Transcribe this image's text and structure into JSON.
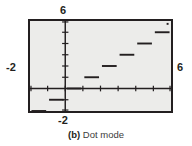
{
  "figure": {
    "caption_letter": "(b)",
    "caption_text": "Dot mode",
    "screen_background": "#ececea",
    "ink_color": "#231f20"
  },
  "axis_labels": {
    "top": "6",
    "left": "-2",
    "right": "6",
    "bottom": "-2"
  },
  "chart_data": {
    "type": "line",
    "title": "Dot mode",
    "xlabel": "",
    "ylabel": "",
    "xlim": [
      -2,
      6
    ],
    "ylim": [
      -2,
      6
    ],
    "grid": false,
    "legend": false,
    "x_ticks": [
      -2,
      -1,
      0,
      1,
      2,
      3,
      4,
      5,
      6
    ],
    "y_ticks": [
      -2,
      -1,
      0,
      1,
      2,
      3,
      4,
      5,
      6
    ],
    "x_tick_labels": [
      "-2",
      "",
      "",
      "",
      "",
      "",
      "",
      "",
      "6"
    ],
    "y_tick_labels": [
      "-2",
      "",
      "",
      "",
      "",
      "",
      "",
      "",
      "6"
    ],
    "series": [
      {
        "name": "y = int(x)",
        "style": "step-dot",
        "color": "#231f20",
        "segments": [
          {
            "x0": -2,
            "x1": -1,
            "y": -2
          },
          {
            "x0": -1,
            "x1": 0,
            "y": -1
          },
          {
            "x0": 0,
            "x1": 1,
            "y": 0
          },
          {
            "x0": 1,
            "x1": 2,
            "y": 1
          },
          {
            "x0": 2,
            "x1": 3,
            "y": 2
          },
          {
            "x0": 3,
            "x1": 4,
            "y": 3
          },
          {
            "x0": 4,
            "x1": 5,
            "y": 4
          },
          {
            "x0": 5,
            "x1": 6,
            "y": 5
          }
        ]
      }
    ]
  }
}
